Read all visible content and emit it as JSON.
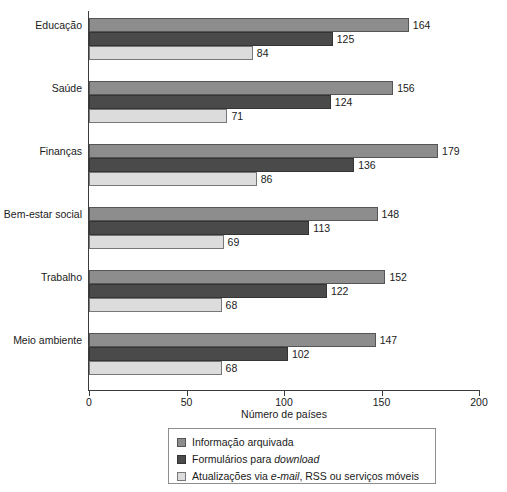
{
  "chart_data": {
    "type": "bar",
    "orientation": "horizontal",
    "title": "",
    "xlabel": "Número de países",
    "ylabel": "",
    "xlim": [
      0,
      200
    ],
    "xticks": [
      0,
      50,
      100,
      150,
      200
    ],
    "grid": false,
    "legend_position": "bottom-center",
    "categories": [
      "Educação",
      "Saúde",
      "Finanças",
      "Bem-estar social",
      "Trabalho",
      "Meio ambiente"
    ],
    "series": [
      {
        "name": "Informação arquivada",
        "color": "#8d8d8d",
        "values": [
          164,
          156,
          179,
          148,
          152,
          147
        ]
      },
      {
        "name": "Formulários para download",
        "color": "#4a4a4a",
        "values": [
          125,
          124,
          136,
          113,
          122,
          102
        ]
      },
      {
        "name": "Atualizações via e-mail, RSS ou serviços móveis",
        "color": "#dcdcdc",
        "values": [
          84,
          71,
          86,
          69,
          68,
          68
        ]
      }
    ],
    "legend_entries": [
      {
        "label_pre": "Informação arquivada",
        "label_italic": "",
        "label_post": ""
      },
      {
        "label_pre": "Formulários para ",
        "label_italic": "download",
        "label_post": ""
      },
      {
        "label_pre": "Atualizações via ",
        "label_italic": "e-mail",
        "label_post": ", RSS ou serviços móveis"
      }
    ]
  }
}
